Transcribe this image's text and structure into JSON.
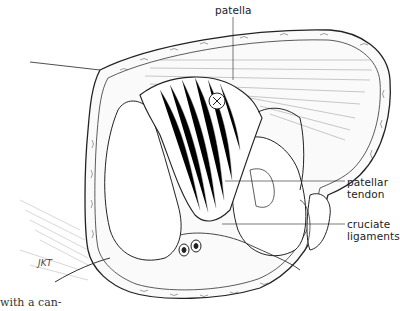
{
  "figure": {
    "labels": {
      "patella": "patella",
      "patellar_tendon_line1": "patellar",
      "patellar_tendon_line2": "tendon",
      "cruciate_line1": "cruciate",
      "cruciate_line2": "ligaments"
    },
    "signature": "JKT",
    "caption_fragment": "with a can-"
  },
  "colors": {
    "ink": "#222222",
    "background": "#ffffff"
  }
}
